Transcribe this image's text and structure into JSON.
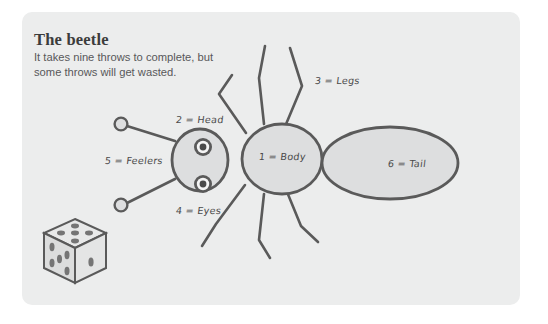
{
  "card": {
    "title": "The beetle",
    "subtitle_line1": "It takes nine throws to complete, but",
    "subtitle_line2": "some throws will get wasted.",
    "background_color": "#eceded",
    "page_background_color": "#ffffff"
  },
  "diagram": {
    "name": "beetle-drawing-game-diagram",
    "stroke_color": "#5a5a5a",
    "fill_color": "#dddedf",
    "labels": [
      {
        "id": "body",
        "text": "1 = Body",
        "number": 1,
        "part": "Body",
        "x": 259,
        "y": 157
      },
      {
        "id": "head",
        "text": "2 = Head",
        "number": 2,
        "part": "Head",
        "x": 176,
        "y": 120
      },
      {
        "id": "legs",
        "text": "3 = Legs",
        "number": 3,
        "part": "Legs",
        "x": 315,
        "y": 81
      },
      {
        "id": "eyes",
        "text": "4 = Eyes",
        "number": 4,
        "part": "Eyes",
        "x": 176,
        "y": 211
      },
      {
        "id": "feelers",
        "text": "5 = Feelers",
        "number": 5,
        "part": "Feelers",
        "x": 105,
        "y": 161
      },
      {
        "id": "tail",
        "text": "6 = Tail",
        "number": 6,
        "part": "Tail",
        "x": 388,
        "y": 164
      }
    ],
    "die": {
      "name": "isometric-die",
      "top_face_pips": 5,
      "left_face_pips": 5,
      "right_face_pips": 1,
      "face_color": "#e0e1e2",
      "pip_color": "#777777"
    }
  }
}
